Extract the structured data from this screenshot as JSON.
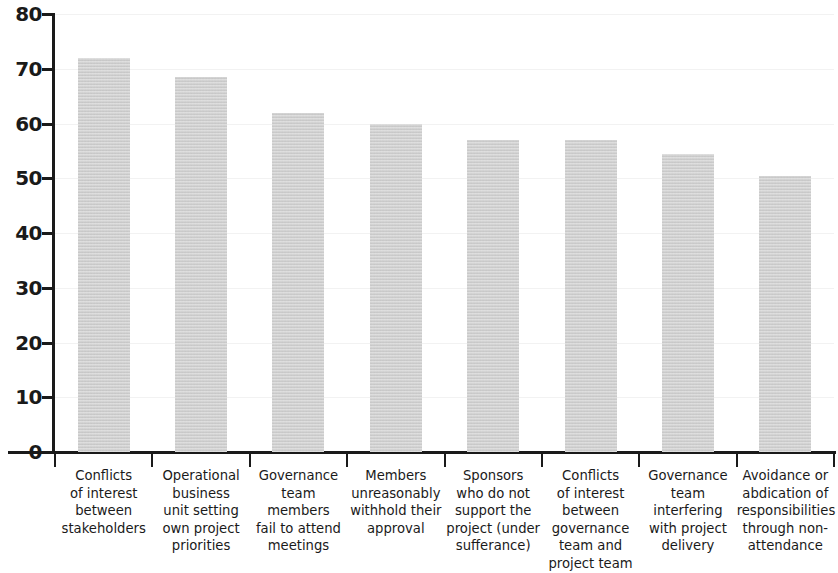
{
  "chart_data": {
    "type": "bar",
    "title": "",
    "subtitle": "",
    "xlabel": "",
    "ylabel": "",
    "ylim": [
      0,
      80
    ],
    "yticks": [
      0,
      10,
      20,
      30,
      40,
      50,
      60,
      70,
      80
    ],
    "grid": true,
    "grid_axis": "y",
    "legend": false,
    "legend_position": "none",
    "bar_color": "#cbcbcb",
    "axis_color": "#1a1a1a",
    "gridline_color": "#f2f2f2",
    "categories": [
      "Conflicts of interest between stakeholders",
      "Operational business unit setting own project priorities",
      "Governance team members fail to attend meetings",
      "Members unreasonably withhold their approval",
      "Sponsors who do not support the project (under sufferance)",
      "Conflicts of interest between governance team and project team",
      "Governance team interfering with project delivery",
      "Avoidance or abdication of responsibilities through non-attendance"
    ],
    "category_lines": [
      [
        "Conflicts",
        "of interest",
        "between",
        "stakeholders"
      ],
      [
        "Operational",
        "business",
        "unit setting",
        "own project",
        "priorities"
      ],
      [
        "Governance",
        "team members",
        "fail to attend",
        "meetings"
      ],
      [
        "Members",
        "unreasonably",
        "withhold their",
        "approval"
      ],
      [
        "Sponsors",
        "who do not",
        "support the",
        "project (under",
        "sufferance)"
      ],
      [
        "Conflicts",
        "of interest",
        "between",
        "governance",
        "team and",
        "project team"
      ],
      [
        "Governance",
        "team",
        "interfering",
        "with project",
        "delivery"
      ],
      [
        "Avoidance or",
        "abdication of",
        "responsibilities",
        "through non-",
        "attendance"
      ]
    ],
    "values": [
      72,
      68.5,
      62,
      60,
      57,
      57,
      54.5,
      50.5
    ]
  }
}
